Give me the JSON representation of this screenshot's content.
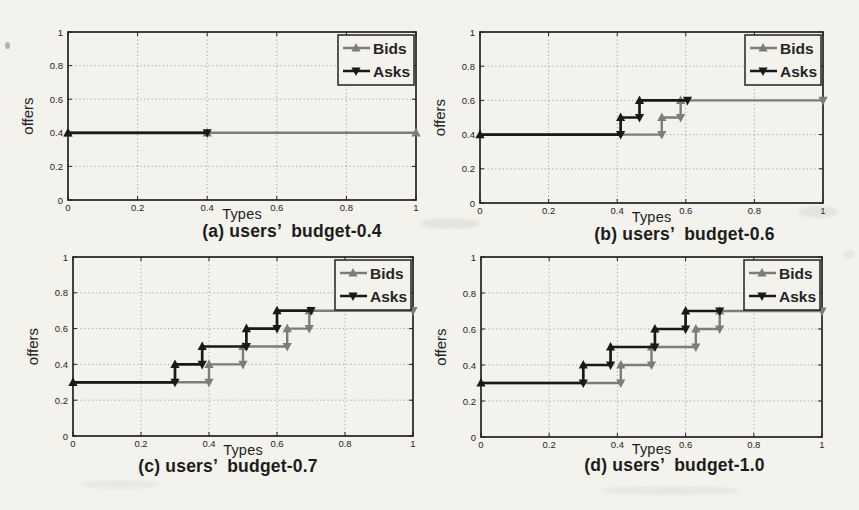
{
  "figure": {
    "background": "#f4f2ed",
    "ink": "#222222",
    "grid_color": "#9b9b9b",
    "bids_color": "#7c7c7c",
    "asks_color": "#191919"
  },
  "chart_data": [
    {
      "id": "a",
      "type": "line",
      "caption": "(a) users’  budget-0.4",
      "xlabel": "Types",
      "ylabel": "offers",
      "xlim": [
        0,
        1
      ],
      "ylim": [
        0,
        1
      ],
      "xticks": [
        "0",
        "0.2",
        "0.4",
        "0.6",
        "0.8",
        "1"
      ],
      "yticks": [
        "0",
        "0.2",
        "0.4",
        "0.6",
        "0.8",
        "1"
      ],
      "legend": [
        "Bids",
        "Asks"
      ],
      "legend_position": "top-right",
      "grid": true,
      "series": [
        {
          "name": "Bids",
          "color": "#7c7c7c",
          "points": [
            [
              0,
              0.4
            ],
            [
              1,
              0.4
            ]
          ],
          "markers": [
            [
              0,
              0.4,
              "up"
            ],
            [
              0.4,
              0.4,
              "up"
            ],
            [
              1,
              0.4,
              "up"
            ]
          ]
        },
        {
          "name": "Asks",
          "color": "#191919",
          "points": [
            [
              0,
              0.4
            ],
            [
              0.4,
              0.4
            ]
          ],
          "markers": [
            [
              0,
              0.4,
              "up"
            ],
            [
              0.4,
              0.4,
              "down"
            ]
          ]
        }
      ]
    },
    {
      "id": "b",
      "type": "line",
      "caption": "(b) users’  budget-0.6",
      "xlabel": "Types",
      "ylabel": "offers",
      "xlim": [
        0,
        1
      ],
      "ylim": [
        0,
        1
      ],
      "xticks": [
        "0",
        "0.2",
        "0.4",
        "0.6",
        "0.8",
        "1"
      ],
      "yticks": [
        "0",
        "0.2",
        "0.4",
        "0.6",
        "0.8",
        "1"
      ],
      "legend": [
        "Bids",
        "Asks"
      ],
      "legend_position": "top-right",
      "grid": true,
      "series": [
        {
          "name": "Bids",
          "color": "#7c7c7c",
          "points": [
            [
              0,
              0.4
            ],
            [
              0.53,
              0.4
            ],
            [
              0.53,
              0.5
            ],
            [
              0.585,
              0.5
            ],
            [
              0.585,
              0.6
            ],
            [
              1,
              0.6
            ]
          ],
          "markers": [
            [
              0.53,
              0.4,
              "down"
            ],
            [
              0.53,
              0.5,
              "up"
            ],
            [
              0.585,
              0.5,
              "down"
            ],
            [
              0.585,
              0.6,
              "up"
            ],
            [
              1,
              0.6,
              "down"
            ]
          ]
        },
        {
          "name": "Asks",
          "color": "#191919",
          "points": [
            [
              0,
              0.4
            ],
            [
              0.41,
              0.4
            ],
            [
              0.41,
              0.5
            ],
            [
              0.465,
              0.5
            ],
            [
              0.465,
              0.6
            ],
            [
              0.605,
              0.6
            ]
          ],
          "markers": [
            [
              0,
              0.4,
              "up"
            ],
            [
              0.41,
              0.4,
              "down"
            ],
            [
              0.41,
              0.5,
              "up"
            ],
            [
              0.465,
              0.5,
              "down"
            ],
            [
              0.465,
              0.6,
              "up"
            ],
            [
              0.605,
              0.6,
              "down"
            ]
          ]
        }
      ]
    },
    {
      "id": "c",
      "type": "line",
      "caption": "(c) users’  budget-0.7",
      "xlabel": "Types",
      "ylabel": "offers",
      "xlim": [
        0,
        1
      ],
      "ylim": [
        0,
        1
      ],
      "xticks": [
        "0",
        "0.2",
        "0.4",
        "0.6",
        "0.8",
        "1"
      ],
      "yticks": [
        "0",
        "0.2",
        "0.4",
        "0.6",
        "0.8",
        "1"
      ],
      "legend": [
        "Bids",
        "Asks"
      ],
      "legend_position": "top-right",
      "grid": true,
      "series": [
        {
          "name": "Bids",
          "color": "#7c7c7c",
          "points": [
            [
              0,
              0.3
            ],
            [
              0.4,
              0.3
            ],
            [
              0.4,
              0.4
            ],
            [
              0.5,
              0.4
            ],
            [
              0.5,
              0.5
            ],
            [
              0.63,
              0.5
            ],
            [
              0.63,
              0.6
            ],
            [
              0.695,
              0.6
            ],
            [
              0.695,
              0.7
            ],
            [
              1,
              0.7
            ]
          ],
          "markers": [
            [
              0.4,
              0.3,
              "down"
            ],
            [
              0.4,
              0.4,
              "up"
            ],
            [
              0.5,
              0.4,
              "down"
            ],
            [
              0.5,
              0.5,
              "up"
            ],
            [
              0.63,
              0.5,
              "down"
            ],
            [
              0.63,
              0.6,
              "up"
            ],
            [
              0.695,
              0.6,
              "down"
            ],
            [
              0.695,
              0.7,
              "up"
            ],
            [
              1,
              0.7,
              "down"
            ]
          ]
        },
        {
          "name": "Asks",
          "color": "#191919",
          "points": [
            [
              0,
              0.3
            ],
            [
              0.3,
              0.3
            ],
            [
              0.3,
              0.4
            ],
            [
              0.38,
              0.4
            ],
            [
              0.38,
              0.5
            ],
            [
              0.51,
              0.5
            ],
            [
              0.51,
              0.6
            ],
            [
              0.6,
              0.6
            ],
            [
              0.6,
              0.7
            ],
            [
              0.7,
              0.7
            ]
          ],
          "markers": [
            [
              0,
              0.3,
              "up"
            ],
            [
              0.3,
              0.3,
              "down"
            ],
            [
              0.3,
              0.4,
              "up"
            ],
            [
              0.38,
              0.4,
              "down"
            ],
            [
              0.38,
              0.5,
              "up"
            ],
            [
              0.51,
              0.5,
              "down"
            ],
            [
              0.51,
              0.6,
              "up"
            ],
            [
              0.6,
              0.6,
              "down"
            ],
            [
              0.6,
              0.7,
              "up"
            ],
            [
              0.7,
              0.7,
              "down"
            ]
          ]
        }
      ]
    },
    {
      "id": "d",
      "type": "line",
      "caption": "(d) users’  budget-1.0",
      "xlabel": "Types",
      "ylabel": "offers",
      "xlim": [
        0,
        1
      ],
      "ylim": [
        0,
        1
      ],
      "xticks": [
        "0",
        "0.2",
        "0.4",
        "0.6",
        "0.8",
        "1"
      ],
      "yticks": [
        "0",
        "0.2",
        "0.4",
        "0.6",
        "0.8",
        "1"
      ],
      "legend": [
        "Bids",
        "Asks"
      ],
      "legend_position": "top-right",
      "grid": true,
      "series": [
        {
          "name": "Bids",
          "color": "#7c7c7c",
          "points": [
            [
              0,
              0.3
            ],
            [
              0.41,
              0.3
            ],
            [
              0.41,
              0.4
            ],
            [
              0.5,
              0.4
            ],
            [
              0.5,
              0.5
            ],
            [
              0.63,
              0.5
            ],
            [
              0.63,
              0.6
            ],
            [
              0.7,
              0.6
            ],
            [
              0.7,
              0.7
            ],
            [
              1,
              0.7
            ]
          ],
          "markers": [
            [
              0.41,
              0.3,
              "down"
            ],
            [
              0.41,
              0.4,
              "up"
            ],
            [
              0.5,
              0.4,
              "down"
            ],
            [
              0.5,
              0.5,
              "up"
            ],
            [
              0.63,
              0.5,
              "down"
            ],
            [
              0.63,
              0.6,
              "up"
            ],
            [
              0.7,
              0.6,
              "down"
            ],
            [
              0.7,
              0.7,
              "up"
            ],
            [
              1,
              0.7,
              "down"
            ]
          ]
        },
        {
          "name": "Asks",
          "color": "#191919",
          "points": [
            [
              0,
              0.3
            ],
            [
              0.3,
              0.3
            ],
            [
              0.3,
              0.4
            ],
            [
              0.38,
              0.4
            ],
            [
              0.38,
              0.5
            ],
            [
              0.51,
              0.5
            ],
            [
              0.51,
              0.6
            ],
            [
              0.6,
              0.6
            ],
            [
              0.6,
              0.7
            ],
            [
              0.7,
              0.7
            ]
          ],
          "markers": [
            [
              0,
              0.3,
              "up"
            ],
            [
              0.3,
              0.3,
              "down"
            ],
            [
              0.3,
              0.4,
              "up"
            ],
            [
              0.38,
              0.4,
              "down"
            ],
            [
              0.38,
              0.5,
              "up"
            ],
            [
              0.51,
              0.5,
              "down"
            ],
            [
              0.51,
              0.6,
              "up"
            ],
            [
              0.6,
              0.6,
              "down"
            ],
            [
              0.6,
              0.7,
              "up"
            ],
            [
              0.7,
              0.7,
              "down"
            ]
          ]
        }
      ]
    }
  ]
}
